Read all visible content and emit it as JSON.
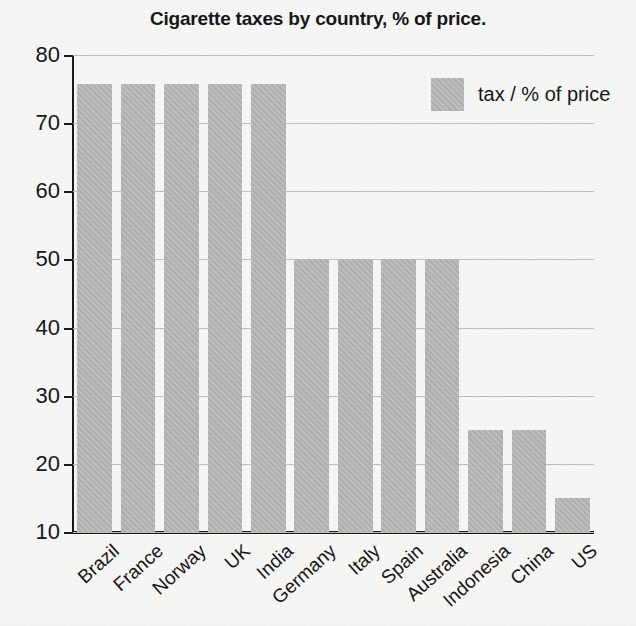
{
  "chart_data": {
    "type": "bar",
    "title": "Cigarette taxes by country, % of price.",
    "xlabel": "",
    "ylabel": "",
    "categories": [
      "Brazil",
      "France",
      "Norway",
      "UK",
      "India",
      "Germany",
      "Italy",
      "Spain",
      "Australia",
      "Indonesia",
      "China",
      "US"
    ],
    "values": [
      75.7,
      75.7,
      75.7,
      75.7,
      75.7,
      50,
      50,
      50,
      50,
      25,
      25,
      15
    ],
    "series": [
      {
        "name": "tax / % of price",
        "values": [
          75.7,
          75.7,
          75.7,
          75.7,
          75.7,
          50,
          50,
          50,
          50,
          25,
          25,
          15
        ]
      }
    ],
    "ylim": [
      10,
      80
    ],
    "ytick_labels": [
      "80",
      "70",
      "60",
      "50",
      "40",
      "30",
      "20",
      "10"
    ],
    "ytick_values": [
      80,
      70,
      60,
      50,
      40,
      30,
      20,
      10
    ],
    "grid": true,
    "legend": {
      "position": "top-right",
      "entries": [
        {
          "label": "tax / % of price",
          "color": "#b2b2b2"
        }
      ]
    },
    "colors": {
      "bar": "#b2b2b2",
      "gridline": "#bdbdbd",
      "axis": "#1a1a1a",
      "background": "#f6f6f4",
      "text": "#16161a"
    }
  }
}
